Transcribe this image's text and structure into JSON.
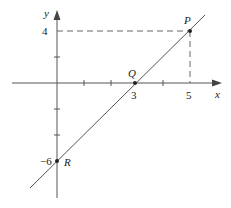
{
  "diagram": {
    "title": "",
    "axes": {
      "x_label": "x",
      "y_label": "y"
    },
    "tick_labels": {
      "x_3": "3",
      "x_5": "5",
      "y_4": "4",
      "y_neg6": "−6"
    },
    "points": {
      "P": {
        "label": "P",
        "x": 5,
        "y": 4
      },
      "Q": {
        "label": "Q",
        "x": 3,
        "y": 0
      },
      "R": {
        "label": "R",
        "x": 0,
        "y": -6
      }
    },
    "line": {
      "slope": 2,
      "intercept": -6,
      "equation": "y = 2x − 6"
    },
    "colors": {
      "stroke": "#555555",
      "dashed": "#666666",
      "text": "#222222"
    }
  }
}
